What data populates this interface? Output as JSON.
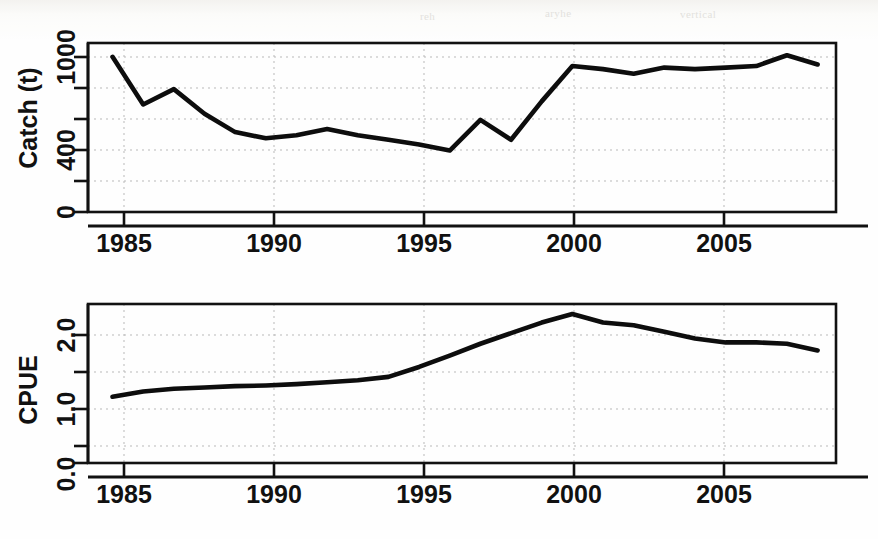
{
  "figure": {
    "background_color": "#ffffff",
    "ink_color": "#0d0d0d",
    "grid_color": "#b9b9b9",
    "ghost_marks": [
      {
        "text": "vertical",
        "x": 700,
        "y": 16
      },
      {
        "text": "reh",
        "x": 430,
        "y": 18
      },
      {
        "text": "aryhe",
        "x": 560,
        "y": 14
      }
    ]
  },
  "panels": [
    {
      "id": "catch",
      "name": "catch-panel",
      "ylabel": "Catch (t)",
      "xlabel": "",
      "y_tick_labels": [
        "0",
        "400",
        "1000"
      ],
      "y_tick_values": [
        0,
        400,
        1000
      ],
      "y_minor_ticks": [
        200,
        600,
        800
      ],
      "x_tick_labels": [
        "1985",
        "1990",
        "1995",
        "2000",
        "2005"
      ],
      "x_tick_values": [
        1985,
        1990,
        1995,
        2000,
        2005
      ]
    },
    {
      "id": "cpue",
      "name": "cpue-panel",
      "ylabel": "CPUE",
      "xlabel": "",
      "y_tick_labels": [
        "0.0",
        "1.0",
        "2.0"
      ],
      "y_tick_values": [
        0.0,
        1.0,
        2.0
      ],
      "y_minor_ticks": [
        0.5,
        1.5
      ],
      "x_tick_labels": [
        "1985",
        "1990",
        "1995",
        "2000",
        "2005"
      ],
      "x_tick_values": [
        1985,
        1990,
        1995,
        2000,
        2005
      ]
    }
  ],
  "chart_data": [
    {
      "type": "line",
      "title": "",
      "xlabel": "",
      "ylabel": "Catch (t)",
      "xlim": [
        1984.2,
        2008.6
      ],
      "ylim": [
        0,
        1100
      ],
      "grid": true,
      "legend": "none",
      "x": [
        1985,
        1986,
        1987,
        1988,
        1989,
        1990,
        1991,
        1992,
        1993,
        1994,
        1995,
        1996,
        1997,
        1998,
        1999,
        2000,
        2001,
        2002,
        2003,
        2004,
        2005,
        2006,
        2007,
        2008
      ],
      "series": [
        {
          "name": "Catch",
          "values": [
            1010,
            700,
            800,
            640,
            520,
            480,
            500,
            540,
            500,
            470,
            440,
            400,
            600,
            470,
            720,
            950,
            930,
            900,
            940,
            930,
            940,
            950,
            1020,
            960
          ]
        }
      ]
    },
    {
      "type": "line",
      "title": "",
      "xlabel": "",
      "ylabel": "CPUE",
      "xlim": [
        1984.2,
        2008.6
      ],
      "ylim": [
        0.0,
        2.4
      ],
      "grid": true,
      "legend": "none",
      "x": [
        1985,
        1986,
        1987,
        1988,
        1989,
        1990,
        1991,
        1992,
        1993,
        1994,
        1995,
        1996,
        1997,
        1998,
        1999,
        2000,
        2001,
        2002,
        2003,
        2004,
        2005,
        2006,
        2007,
        2008
      ],
      "series": [
        {
          "name": "CPUE",
          "values": [
            1.0,
            1.08,
            1.12,
            1.14,
            1.16,
            1.17,
            1.19,
            1.22,
            1.25,
            1.3,
            1.45,
            1.62,
            1.8,
            1.96,
            2.12,
            2.25,
            2.12,
            2.08,
            1.98,
            1.88,
            1.82,
            1.82,
            1.8,
            1.7
          ]
        }
      ]
    }
  ]
}
